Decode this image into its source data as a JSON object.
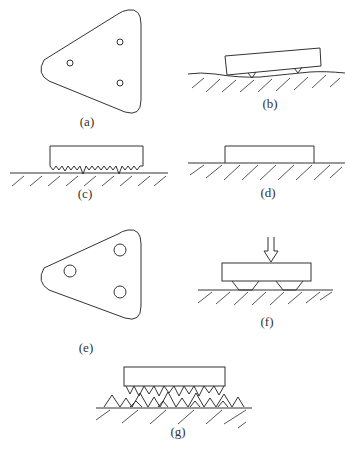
{
  "panels": [
    {
      "id": "a",
      "label": "(a)",
      "description": "Rounded triangular plate with three small contact points"
    },
    {
      "id": "b",
      "label": "(b)",
      "description": "Block tilted, resting on two small contact points over uneven ground"
    },
    {
      "id": "c",
      "label": "(c)",
      "description": "Block with many micro-asperities on its underside resting on ground"
    },
    {
      "id": "d",
      "label": "(d)",
      "description": "Block resting flat on ground"
    },
    {
      "id": "e",
      "label": "(e)",
      "description": "Rounded triangular plate with three larger contact areas"
    },
    {
      "id": "f",
      "label": "(f)",
      "description": "Block pressed down by force arrow, deformed contact pads on ground"
    },
    {
      "id": "g",
      "label": "(g)",
      "description": "Block with asperities interlocking with asperities of the rough ground surface"
    }
  ],
  "colors": {
    "line": "#333333",
    "background": "#ffffff"
  }
}
